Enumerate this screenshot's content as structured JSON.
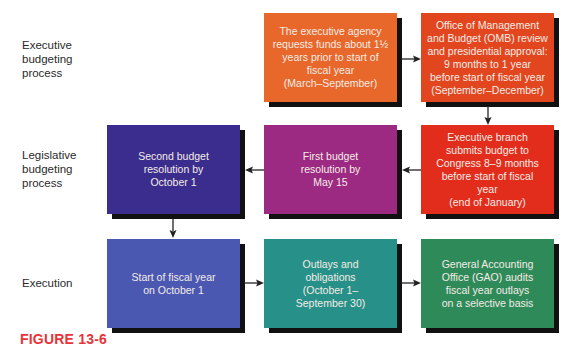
{
  "row_labels": [
    "Executive\nbudgeting\nprocess",
    "Legislative\nbudgeting\nprocess",
    "Execution"
  ],
  "boxes": {
    "agency_request": {
      "text": "The executive agency\nrequests funds about 1½\nyears prior to start of\nfiscal year\n(March–September)",
      "color": "#e8672a"
    },
    "omb_review": {
      "text": "Office of Management\nand Budget (OMB) review\nand presidential approval:\n9 months to 1 year\nbefore start of fiscal year\n(September–December)",
      "color": "#e2461f"
    },
    "exec_submits": {
      "text": "Executive branch\nsubmits budget to\nCongress 8–9 months\nbefore start of fiscal\nyear\n(end of January)",
      "color": "#e32d1c"
    },
    "first_resolution": {
      "text": "First budget\nresolution by\nMay 15",
      "color": "#9c2a82"
    },
    "second_resolution": {
      "text": "Second budget\nresolution by\nOctober 1",
      "color": "#3a2d8e"
    },
    "fiscal_start": {
      "text": "Start of fiscal year\non October 1",
      "color": "#4a58b2"
    },
    "outlays": {
      "text": "Outlays and\nobligations\n(October 1–\nSeptember 30)",
      "color": "#279189"
    },
    "gao_audit": {
      "text": "General Accounting\nOffice (GAO) audits\nfiscal year outlays\non a selective basis",
      "color": "#2f8a5a"
    }
  },
  "figure_caption": "FIGURE 13-6"
}
